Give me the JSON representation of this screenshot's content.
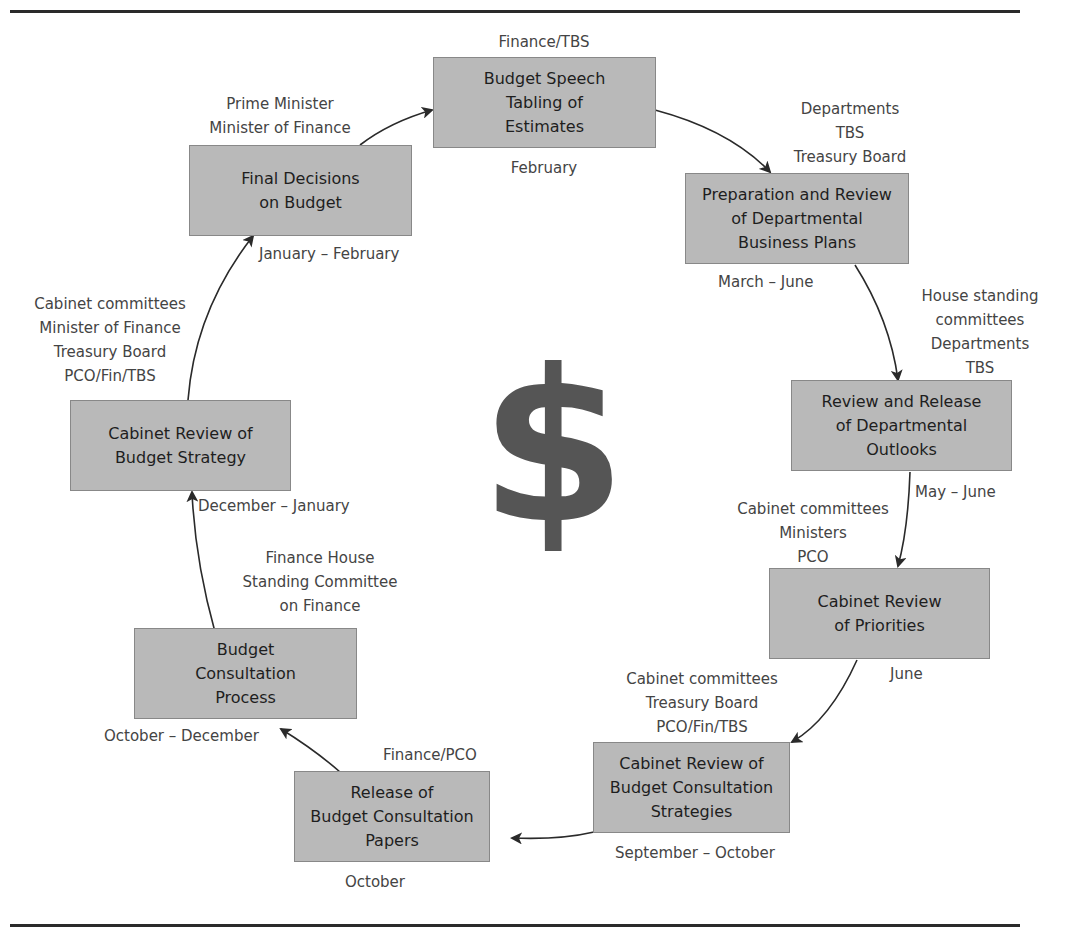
{
  "diagram": {
    "center_symbol": "$",
    "nodes": [
      {
        "id": "budget-speech",
        "label": "Budget Speech\nTabling of\nEstimates",
        "actors": "Finance/TBS",
        "period": "February"
      },
      {
        "id": "business-plans",
        "label": "Preparation and Review\nof Departmental\nBusiness Plans",
        "actors": "Departments\nTBS\nTreasury Board",
        "period": "March – June"
      },
      {
        "id": "departmental-outlooks",
        "label": "Review and Release\nof Departmental\nOutlooks",
        "actors": "House standing\ncommittees\nDepartments\nTBS",
        "period": "May – June"
      },
      {
        "id": "review-priorities",
        "label": "Cabinet Review\nof Priorities",
        "actors": "Cabinet committees\nMinisters\nPCO",
        "period": "June"
      },
      {
        "id": "consultation-strategies",
        "label": "Cabinet Review of\nBudget Consultation\nStrategies",
        "actors": "Cabinet committees\nTreasury Board\nPCO/Fin/TBS",
        "period": "September – October"
      },
      {
        "id": "consultation-papers",
        "label": "Release of\nBudget Consultation\nPapers",
        "actors": "Finance/PCO",
        "period": "October"
      },
      {
        "id": "consultation-process",
        "label": "Budget\nConsultation\nProcess",
        "actors": "Finance House\nStanding Committee\non Finance",
        "period": "October – December"
      },
      {
        "id": "budget-strategy",
        "label": "Cabinet Review of\nBudget Strategy",
        "actors": "Cabinet committees\nMinister of Finance\nTreasury Board\nPCO/Fin/TBS",
        "period": "December – January"
      },
      {
        "id": "final-decisions",
        "label": "Final Decisions\non Budget",
        "actors": "Prime Minister\nMinister of Finance",
        "period": "January – February"
      }
    ],
    "flow_order": [
      "budget-speech",
      "business-plans",
      "departmental-outlooks",
      "review-priorities",
      "consultation-strategies",
      "consultation-papers",
      "consultation-process",
      "budget-strategy",
      "final-decisions",
      "budget-speech"
    ],
    "colors": {
      "box_fill": "#b9b9b9",
      "box_border": "#888888",
      "arrow": "#2a2a2a",
      "rule": "#2a2a2a",
      "dollar": "#555555"
    }
  }
}
